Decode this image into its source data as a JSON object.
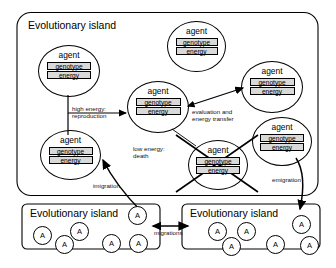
{
  "diagram": {
    "title_text": "Evolutionary island",
    "agent_label": "agent",
    "genotype_label": "genotype",
    "energy_label": "energy",
    "small_agent_label": "A"
  },
  "islands": [
    {
      "id": "main-island",
      "title": "Evolutionary island"
    },
    {
      "id": "left-island",
      "title": "Evolutionary island"
    },
    {
      "id": "right-island",
      "title": "Evolutionary island"
    }
  ],
  "agents": [
    {
      "id": "agent-upper-left",
      "name": "agent",
      "genotype": "genotype",
      "energy": "energy",
      "state": "alive"
    },
    {
      "id": "agent-top-center",
      "name": "agent",
      "genotype": "genotype",
      "energy": "energy",
      "state": "alive"
    },
    {
      "id": "agent-center",
      "name": "agent",
      "genotype": "genotype",
      "energy": "energy",
      "state": "alive"
    },
    {
      "id": "agent-right-upper",
      "name": "agent",
      "genotype": "genotype",
      "energy": "energy",
      "state": "alive"
    },
    {
      "id": "agent-right-lower",
      "name": "agent",
      "genotype": "genotype",
      "energy": "energy",
      "state": "alive"
    },
    {
      "id": "agent-lower-left",
      "name": "agent",
      "genotype": "genotype",
      "energy": "energy",
      "state": "alive"
    },
    {
      "id": "agent-dead",
      "name": "agent",
      "genotype": "genotype",
      "energy": "energy",
      "state": "dead"
    }
  ],
  "edge_labels": {
    "reproduction": "high energy:\nreproduction",
    "evaluation": "evaluation and\nenergy transfer",
    "death": "low energy:\ndeath",
    "immigration": "imigration",
    "emigration": "emigration",
    "migrations": "migrations"
  },
  "small_agents": {
    "left_island": [
      "A",
      "A",
      "A",
      "A",
      "A",
      "A"
    ],
    "right_island": [
      "A",
      "A",
      "A",
      "A",
      "A",
      "A"
    ]
  },
  "colors": {
    "stroke": "#000000",
    "field_fill": "#d9d9d9",
    "background": "#ffffff"
  }
}
